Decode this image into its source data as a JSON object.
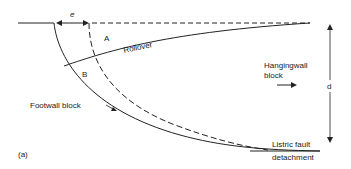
{
  "labels": {
    "e": "e",
    "A": "A",
    "B": "B",
    "rollover": "Rollover",
    "hangingwall_line1": "Hangingwall",
    "hangingwall_line2": "block",
    "d": "d",
    "footwall": "Footwall block",
    "listric_line1": "Listric fault",
    "listric_line2": "detachment",
    "panel": "(a)"
  },
  "colors": {
    "line": "#222222",
    "background": "#ffffff"
  }
}
